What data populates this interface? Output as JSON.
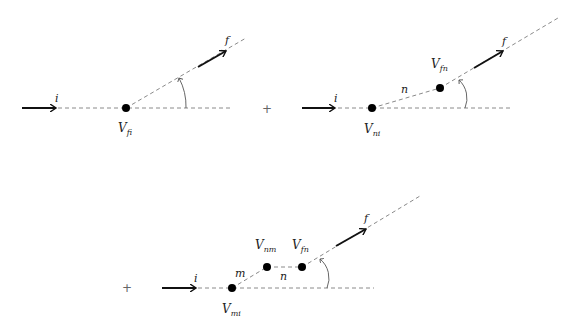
{
  "diagrams": [
    {
      "id": "first-order",
      "vertices": [
        {
          "label_main": "V",
          "label_sub": "fi"
        }
      ],
      "incoming_label": "i",
      "outgoing_label": "f",
      "intermediate_labels": []
    },
    {
      "id": "second-order",
      "vertices": [
        {
          "label_main": "V",
          "label_sub": "ni"
        },
        {
          "label_main": "V",
          "label_sub": "fn"
        }
      ],
      "incoming_label": "i",
      "outgoing_label": "f",
      "intermediate_labels": [
        "n"
      ]
    },
    {
      "id": "third-order",
      "vertices": [
        {
          "label_main": "V",
          "label_sub": "mi"
        },
        {
          "label_main": "V",
          "label_sub": "nm"
        },
        {
          "label_main": "V",
          "label_sub": "fn"
        }
      ],
      "incoming_label": "i",
      "outgoing_label": "f",
      "intermediate_labels": [
        "m",
        "n"
      ]
    }
  ],
  "operators": {
    "plus": "+"
  }
}
